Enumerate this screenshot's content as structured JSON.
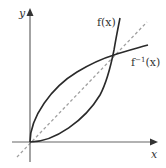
{
  "diagram": {
    "axes": {
      "x_label": "x",
      "y_label": "y",
      "color": "#555555"
    },
    "curves": [
      {
        "name": "f",
        "label": "f(x)",
        "color": "#2a2a2a",
        "shape": "convex, increasing from origin"
      },
      {
        "name": "f_inverse",
        "label_base": "f",
        "label_sup": "−1",
        "label_arg": "(x)",
        "color": "#2a2a2a",
        "shape": "concave, increasing from origin"
      }
    ],
    "reference_line": {
      "name": "y = x",
      "style": "dashed",
      "color": "#999999"
    },
    "intersection": {
      "description": "f(x) and f⁻¹(x) intersect on y = x"
    }
  }
}
